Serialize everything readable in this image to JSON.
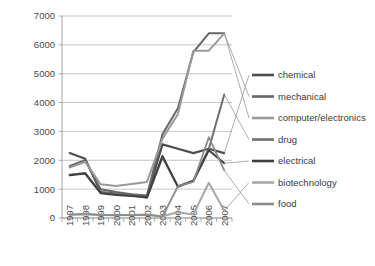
{
  "chart_data": {
    "type": "line",
    "title": "",
    "subtitle": "",
    "xlabel": "",
    "ylabel": "",
    "categories": [
      "1997",
      "1998",
      "1999",
      "2000",
      "2001",
      "2002",
      "2003",
      "2004",
      "2005",
      "2006",
      "2007"
    ],
    "x": [
      1997,
      1998,
      1999,
      2000,
      2001,
      2002,
      2003,
      2004,
      2005,
      2006,
      2007
    ],
    "ylim": [
      0,
      7000
    ],
    "ytick_values": [
      0,
      1000,
      2000,
      3000,
      4000,
      5000,
      6000,
      7000
    ],
    "ytick_labels": [
      "0",
      "1000",
      "2000",
      "3000",
      "4000",
      "5000",
      "6000",
      "7000"
    ],
    "grid": true,
    "legend_position": "right",
    "series": [
      {
        "name": "chemical",
        "color": "#4d4d4d",
        "width": 2.2,
        "values": [
          2250,
          2050,
          900,
          850,
          800,
          750,
          2550,
          2400,
          2250,
          2400,
          2250
        ]
      },
      {
        "name": "mechanical",
        "color": "#666666",
        "width": 2.0,
        "values": [
          1800,
          2000,
          1000,
          900,
          820,
          780,
          2900,
          3800,
          5750,
          6400,
          6400
        ]
      },
      {
        "name": "computer/electronics",
        "color": "#9a9a9a",
        "width": 2.0,
        "values": [
          1750,
          1950,
          1170,
          1110,
          1180,
          1250,
          2750,
          3600,
          5800,
          5800,
          6400
        ]
      },
      {
        "name": "drug",
        "color": "#707070",
        "width": 2.0,
        "values": [
          1500,
          1560,
          880,
          830,
          790,
          700,
          2100,
          1100,
          1300,
          2400,
          4280
        ]
      },
      {
        "name": "electrical",
        "color": "#3f3f3f",
        "width": 2.0,
        "values": [
          1480,
          1540,
          860,
          800,
          760,
          720,
          2150,
          1080,
          1280,
          2350,
          1900
        ]
      },
      {
        "name": "biotechnology",
        "color": "#a8a8a8",
        "width": 2.0,
        "values": [
          120,
          150,
          110,
          100,
          105,
          120,
          60,
          200,
          120,
          1220,
          250
        ]
      },
      {
        "name": "food",
        "color": "#8c8c8c",
        "width": 1.8,
        "values": [
          110,
          130,
          100,
          95,
          100,
          110,
          50,
          1100,
          1250,
          2800,
          1650
        ]
      }
    ],
    "legend_entries": [
      {
        "label": "chemical",
        "color": "#4d4d4d"
      },
      {
        "label": "mechanical",
        "color": "#666666"
      },
      {
        "label": "computer/electronics",
        "color": "#9a9a9a"
      },
      {
        "label": "drug",
        "color": "#707070"
      },
      {
        "label": "electrical",
        "color": "#3f3f3f"
      },
      {
        "label": "biotechnology",
        "color": "#a8a8a8"
      },
      {
        "label": "food",
        "color": "#8c8c8c"
      }
    ],
    "colors": {
      "gridline": "#b8b8b8",
      "axis": "#9a9a9a",
      "text": "#4a4a4a",
      "background": "#ffffff"
    }
  }
}
